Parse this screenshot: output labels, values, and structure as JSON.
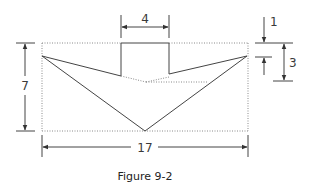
{
  "figure": {
    "caption": "Figure 9-2",
    "dimensions": {
      "top_width": "4",
      "left_height": "7",
      "bottom_width": "17",
      "right_small": "1",
      "right_large": "3"
    },
    "colors": {
      "line": "#444444",
      "dotted": "#8a8a8a",
      "text": "#333333"
    }
  }
}
